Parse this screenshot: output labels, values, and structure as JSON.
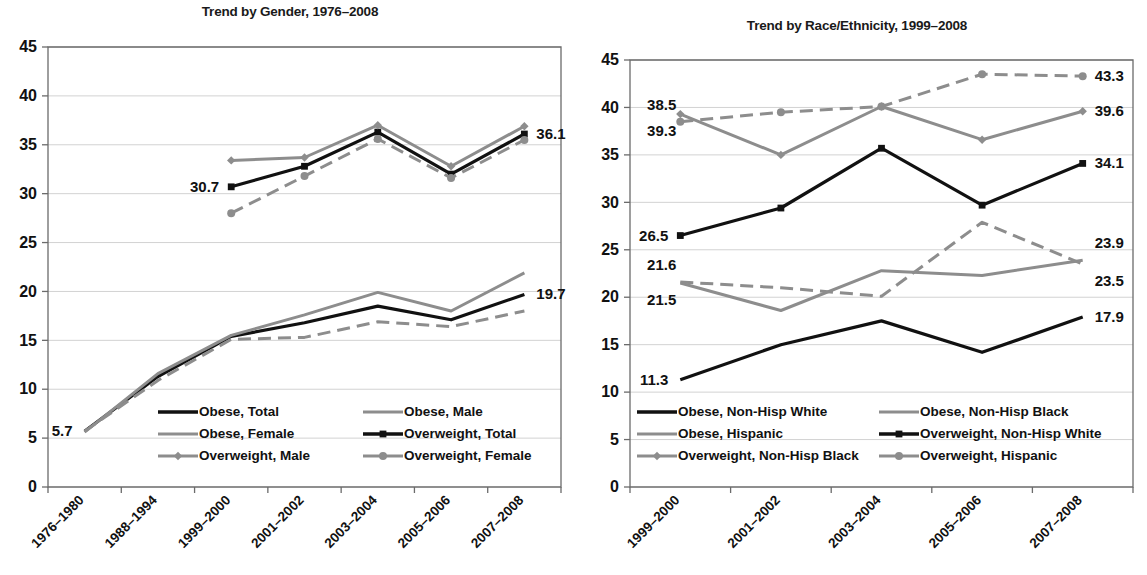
{
  "figure": {
    "background": "#ffffff",
    "panels": [
      "gender",
      "race"
    ]
  },
  "colors": {
    "black": "#111111",
    "gray": "#8d8d8d",
    "gridline": "#d2d2d2",
    "axis": "#6b6b6b",
    "text": "#111111"
  },
  "chart_data": [
    {
      "id": "gender",
      "type": "line",
      "title": "Trend by Gender, 1976–2008",
      "xlabel": "",
      "ylabel": "",
      "ylim": [
        0,
        45
      ],
      "yticks": [
        "0",
        "5",
        "10",
        "15",
        "20",
        "25",
        "30",
        "35",
        "40",
        "45"
      ],
      "grid": true,
      "legend_position": "inside-bottom",
      "categories": [
        "1976–1980",
        "1988–1994",
        "1999–2000",
        "2001–2002",
        "2003–2004",
        "2005–2006",
        "2007–2008"
      ],
      "series": [
        {
          "name": "Obese, Total",
          "color": "#111111",
          "style": "solid",
          "marker": "none",
          "values": [
            5.7,
            11.3,
            15.4,
            16.8,
            18.5,
            17.1,
            19.7
          ]
        },
        {
          "name": "Obese, Male",
          "color": "#8d8d8d",
          "style": "solid",
          "marker": "none",
          "values": [
            5.6,
            11.6,
            15.5,
            17.6,
            19.9,
            18.0,
            21.9
          ]
        },
        {
          "name": "Obese, Female",
          "color": "#8d8d8d",
          "style": "dashed",
          "marker": "none",
          "values": [
            5.7,
            10.9,
            15.1,
            15.3,
            16.9,
            16.4,
            18.0
          ]
        },
        {
          "name": "Overweight, Total",
          "color": "#111111",
          "style": "solid",
          "marker": "square",
          "values": [
            null,
            null,
            30.7,
            32.8,
            36.3,
            32.0,
            36.1
          ]
        },
        {
          "name": "Overweight, Male",
          "color": "#8d8d8d",
          "style": "solid",
          "marker": "diamond",
          "values": [
            null,
            null,
            33.4,
            33.7,
            37.0,
            32.8,
            36.9
          ]
        },
        {
          "name": "Overweight, Female",
          "color": "#8d8d8d",
          "style": "dashed",
          "marker": "circle",
          "values": [
            null,
            null,
            28.0,
            31.8,
            35.6,
            31.6,
            35.5
          ]
        }
      ],
      "annotations": [
        {
          "text": "5.7",
          "category": "1976–1980",
          "value": 5.7,
          "align": "left"
        },
        {
          "text": "30.7",
          "category": "1999–2000",
          "value": 30.7,
          "align": "left"
        },
        {
          "text": "36.1",
          "category": "2007–2008",
          "value": 36.1,
          "align": "right"
        },
        {
          "text": "19.7",
          "category": "2007–2008",
          "value": 19.7,
          "align": "right"
        }
      ]
    },
    {
      "id": "race",
      "type": "line",
      "title": "Trend by Race/Ethnicity, 1999–2008",
      "xlabel": "",
      "ylabel": "",
      "ylim": [
        0,
        45
      ],
      "yticks": [
        "0",
        "5",
        "10",
        "15",
        "20",
        "25",
        "30",
        "35",
        "40",
        "45"
      ],
      "grid": true,
      "legend_position": "inside-bottom",
      "categories": [
        "1999–2000",
        "2001–2002",
        "2003–2004",
        "2005–2006",
        "2007–2008"
      ],
      "series": [
        {
          "name": "Obese, Non-Hisp White",
          "color": "#111111",
          "style": "solid",
          "marker": "none",
          "values": [
            11.3,
            15.0,
            17.5,
            14.2,
            17.9
          ]
        },
        {
          "name": "Obese, Non-Hisp Black",
          "color": "#8d8d8d",
          "style": "solid",
          "marker": "none",
          "values": [
            21.5,
            18.6,
            22.8,
            22.3,
            23.9
          ]
        },
        {
          "name": "Obese, Hispanic",
          "color": "#8d8d8d",
          "style": "dashed",
          "marker": "none",
          "values": [
            21.6,
            21.0,
            20.1,
            27.9,
            23.5
          ]
        },
        {
          "name": "Overweight, Non-Hisp White",
          "color": "#111111",
          "style": "solid",
          "marker": "square",
          "values": [
            26.5,
            29.4,
            35.7,
            29.7,
            34.1
          ]
        },
        {
          "name": "Overweight, Non-Hisp Black",
          "color": "#8d8d8d",
          "style": "solid",
          "marker": "diamond",
          "values": [
            39.3,
            35.0,
            40.1,
            36.6,
            39.6
          ]
        },
        {
          "name": "Overweight, Hispanic",
          "color": "#8d8d8d",
          "style": "dashed",
          "marker": "circle",
          "values": [
            38.5,
            39.5,
            40.1,
            43.5,
            43.3
          ]
        }
      ],
      "annotations": [
        {
          "text": "38.5",
          "category": "1999–2000",
          "value": 38.5,
          "align": "left-above"
        },
        {
          "text": "39.3",
          "category": "1999–2000",
          "value": 39.3,
          "align": "left-below"
        },
        {
          "text": "26.5",
          "category": "1999–2000",
          "value": 26.5,
          "align": "left"
        },
        {
          "text": "21.6",
          "category": "1999–2000",
          "value": 21.6,
          "align": "left-above"
        },
        {
          "text": "21.5",
          "category": "1999–2000",
          "value": 21.5,
          "align": "left-below"
        },
        {
          "text": "11.3",
          "category": "1999–2000",
          "value": 11.3,
          "align": "left"
        },
        {
          "text": "43.3",
          "category": "2007–2008",
          "value": 43.3,
          "align": "right"
        },
        {
          "text": "39.6",
          "category": "2007–2008",
          "value": 39.6,
          "align": "right"
        },
        {
          "text": "34.1",
          "category": "2007–2008",
          "value": 34.1,
          "align": "right"
        },
        {
          "text": "23.9",
          "category": "2007–2008",
          "value": 23.9,
          "align": "right-above"
        },
        {
          "text": "23.5",
          "category": "2007–2008",
          "value": 23.5,
          "align": "right-below"
        },
        {
          "text": "17.9",
          "category": "2007–2008",
          "value": 17.9,
          "align": "right"
        }
      ]
    }
  ]
}
